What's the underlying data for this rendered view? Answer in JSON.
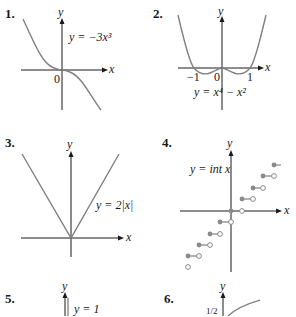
{
  "graphs": [
    {
      "number": "1.",
      "equation": "y = −3x³",
      "axis_x": "x",
      "axis_y": "y",
      "origin_label": "0"
    },
    {
      "number": "2.",
      "equation": "y = x⁴ − x²",
      "axis_x": "x",
      "axis_y": "y",
      "ticks": [
        "−1",
        "0",
        "1"
      ]
    },
    {
      "number": "3.",
      "equation": "y = 2|x|",
      "axis_x": "x",
      "axis_y": "y"
    },
    {
      "number": "4.",
      "equation": "y = int x",
      "axis_x": "x",
      "axis_y": "y"
    },
    {
      "number": "5.",
      "equation": "y = 1",
      "axis_y": "y"
    },
    {
      "number": "6.",
      "axis_y": "y",
      "partial_label": "1/2"
    }
  ],
  "colors": {
    "curve": "#808080",
    "axis": "#1a1a1a",
    "dot": "#8a8a8a"
  }
}
